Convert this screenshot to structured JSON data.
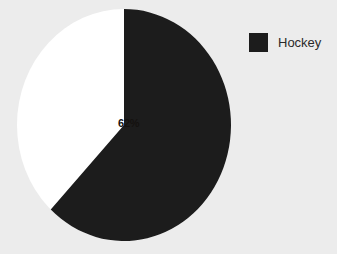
{
  "chart_data": {
    "type": "pie",
    "title": "",
    "categories": [
      "Hockey",
      "Other"
    ],
    "values": [
      62,
      38
    ],
    "labels": [
      "62%",
      ""
    ],
    "legend": {
      "position": "top-right",
      "entries": [
        {
          "label": "Hockey",
          "color": "#1c1c1c"
        }
      ]
    },
    "slices": [
      {
        "name": "Hockey",
        "value": 62,
        "label": "62%",
        "color": "#1c1c1c",
        "start_angle": 0,
        "sweep_angle": 223.2
      },
      {
        "name": "Other",
        "value": 38,
        "label": "",
        "color": "#ffffff",
        "start_angle": 223.2,
        "sweep_angle": 136.8
      }
    ],
    "grid": false,
    "xlabel": "",
    "ylabel": ""
  },
  "colors": {
    "background": "#ececec",
    "slice_dark": "#1c1c1c",
    "slice_light": "#ffffff",
    "label_text": "#14110f",
    "legend_text": "#2a2a2a"
  },
  "legend": {
    "items": [
      {
        "label": "Hockey"
      }
    ]
  },
  "pie": {
    "label_hockey": "62%"
  }
}
